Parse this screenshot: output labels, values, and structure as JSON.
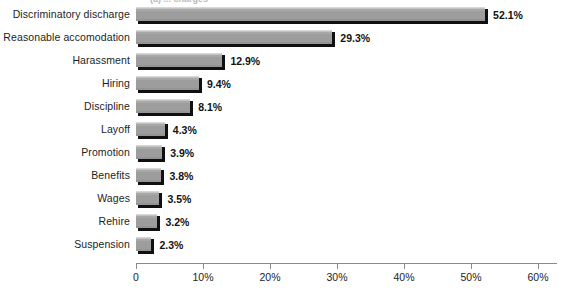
{
  "chart_data": {
    "type": "bar",
    "orientation": "horizontal",
    "title": "",
    "title_partial": "(a) ... charges",
    "xlabel": "",
    "ylabel": "",
    "xlim": [
      0,
      60
    ],
    "grid": false,
    "legend": null,
    "categories": [
      "Discriminatory discharge",
      "Reasonable accomodation",
      "Harassment",
      "Hiring",
      "Discipline",
      "Layoff",
      "Promotion",
      "Benefits",
      "Wages",
      "Rehire",
      "Suspension"
    ],
    "values": [
      52.1,
      29.3,
      12.9,
      9.4,
      8.1,
      4.3,
      3.9,
      3.8,
      3.5,
      3.2,
      2.3
    ],
    "value_labels": [
      "52.1%",
      "29.3%",
      "12.9%",
      "9.4%",
      "8.1%",
      "4.3%",
      "3.9%",
      "3.8%",
      "3.5%",
      "3.2%",
      "2.3%"
    ],
    "xticks": [
      0,
      10,
      20,
      30,
      40,
      50,
      60
    ],
    "xtick_labels": [
      "0",
      "10%",
      "20%",
      "30%",
      "40%",
      "50%",
      "60%"
    ],
    "bar_color": "#9d9d9d",
    "bar_shadow_color": "#101010",
    "background_color": "#ffffff",
    "text_color": "#1d1d1d"
  }
}
